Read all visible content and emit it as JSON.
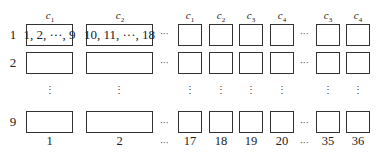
{
  "diagram": {
    "rows": [
      "1",
      "2",
      "9"
    ],
    "vertical_ellipsis": "⋮",
    "horizontal_ellipsis": "···",
    "columns": [
      {
        "id": "col1",
        "header": "c",
        "sub": "1",
        "content_row1": "1, 2, ···, 9",
        "bottom_label": "1"
      },
      {
        "id": "col2",
        "header": "c",
        "sub": "2",
        "content_row1": "10, 11, ···, 18",
        "bottom_label": "2"
      },
      {
        "id": "col17",
        "header": "c",
        "sub": "1",
        "content_row1": "",
        "bottom_label": "17"
      },
      {
        "id": "col18",
        "header": "c",
        "sub": "2",
        "content_row1": "",
        "bottom_label": "18"
      },
      {
        "id": "col19",
        "header": "c",
        "sub": "3",
        "content_row1": "",
        "bottom_label": "19"
      },
      {
        "id": "col20",
        "header": "c",
        "sub": "4",
        "content_row1": "",
        "bottom_label": "20"
      },
      {
        "id": "col35",
        "header": "c",
        "sub": "3",
        "content_row1": "",
        "bottom_label": "35"
      },
      {
        "id": "col36",
        "header": "c",
        "sub": "4",
        "content_row1": "",
        "bottom_label": "36"
      }
    ]
  }
}
